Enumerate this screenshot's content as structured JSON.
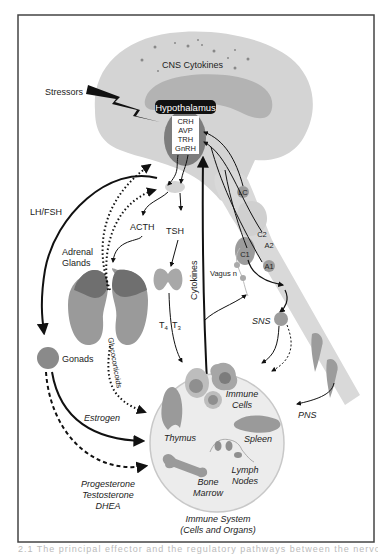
{
  "figure": {
    "title_region": "CNS Cytokines",
    "stressors": "Stressors",
    "hypothalamus": {
      "label": "Hypothalamus",
      "hormones": [
        "CRH",
        "AVP",
        "TRH",
        "GnRH"
      ]
    },
    "brainstem_nuclei": [
      "LC",
      "C2",
      "A2",
      "C1",
      "A1"
    ],
    "pituitary_outputs": {
      "acth": "ACTH",
      "tsh": "TSH",
      "lh_fsh": "LH/FSH"
    },
    "organs": {
      "adrenal_line1": "Adrenal",
      "adrenal_line2": "Glands",
      "gonads": "Gonads",
      "t4": "T",
      "t4_sub": "4",
      "t3": "T",
      "t3_sub": "3"
    },
    "pathways": {
      "cytokines": "Cytokines",
      "vagus": "Vagus n",
      "sns": "SNS",
      "pns": "PNS",
      "glucocorticoids": "Glucocorticoids",
      "estrogen": "Estrogen",
      "sex_steroids": [
        "Progesterone",
        "Testosterone",
        "DHEA"
      ]
    },
    "immune_system": {
      "title_line1": "Immune System",
      "title_line2": "(Cells and Organs)",
      "immune_cells_line1": "Immune",
      "immune_cells_line2": "Cells",
      "thymus": "Thymus",
      "spleen": "Spleen",
      "lymph_line1": "Lymph",
      "lymph_line2": "Nodes",
      "bone_line1": "Bone",
      "bone_line2": "Marrow"
    },
    "colors": {
      "brain_light": "#d4d4d4",
      "brain_mid": "#b3b3b3",
      "organ_gray": "#9a9a9a",
      "organ_dark": "#6f6f6f",
      "hypothalamus_box": "#111111",
      "frame": "#444444"
    }
  },
  "caption": "2.1  The principal effector and the regulatory pathways between the nervous system and"
}
